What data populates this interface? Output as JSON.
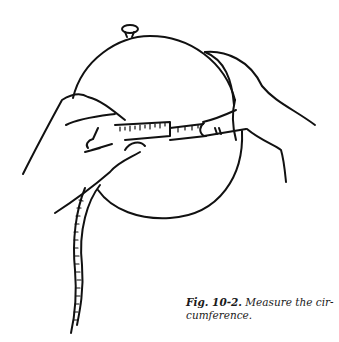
{
  "figure": {
    "illustration": "hands measuring balloon circumference with tape measure",
    "caption": {
      "label": "Fig. 10-2.",
      "text": " Measure the cir-cumference.",
      "line1_text": " Measure the cir-",
      "line2_text": "cumference."
    },
    "colors": {
      "ink": "#111111",
      "background": "#ffffff"
    }
  }
}
